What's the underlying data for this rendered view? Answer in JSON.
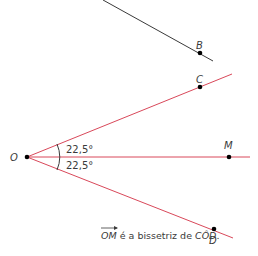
{
  "diagram": {
    "points": {
      "O": {
        "label": "O",
        "x": 27,
        "y": 157
      },
      "B": {
        "label": "B",
        "x": 200,
        "y": 53
      },
      "C": {
        "label": "C",
        "x": 200,
        "y": 87
      },
      "M": {
        "label": "M",
        "x": 229,
        "y": 157
      },
      "D": {
        "label": "D",
        "x": 214,
        "y": 229
      }
    },
    "angles": {
      "upper": "22,5°",
      "lower": "22,5°"
    },
    "caption": {
      "vector": "OM",
      "text": " é a bissetriz de ",
      "angle": "CÔD",
      "end": "."
    },
    "colors": {
      "ray_color": "#d9485a",
      "line_color": "#3a3a3a",
      "point_color": "#000000"
    }
  }
}
